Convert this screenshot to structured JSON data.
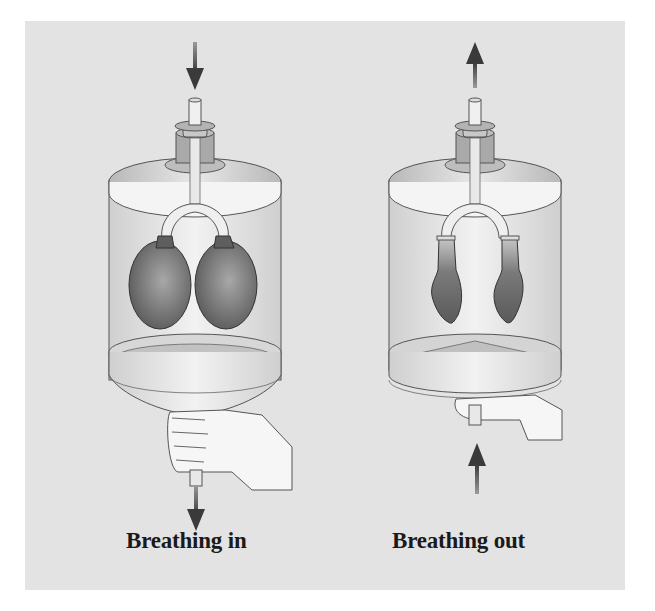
{
  "figure": {
    "background_color": "#e3e3e3",
    "panels": [
      {
        "id": "left",
        "label": "Breathing in",
        "balloon_state": "inflated",
        "air_arrow": "down-into-tube",
        "diaphragm_state": "pulled-down",
        "hand_action": "pulling-down"
      },
      {
        "id": "right",
        "label": "Breathing out",
        "balloon_state": "deflated",
        "air_arrow": "up-out-of-tube",
        "diaphragm_state": "pushed-up",
        "hand_action": "pushing-up"
      }
    ]
  }
}
